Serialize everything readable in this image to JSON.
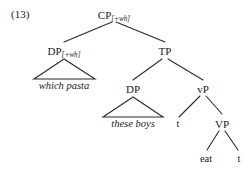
{
  "figure": {
    "example_number": "(13)",
    "type": "syntax-tree",
    "line_color": "#2b2b2b",
    "text_color": "#1a1a1a",
    "background": "#ffffff"
  },
  "nodes": {
    "cp": {
      "label": "CP",
      "subscript": "[+wh]"
    },
    "dp_wh": {
      "label": "DP",
      "subscript": "[+wh]"
    },
    "tp": {
      "label": "TP",
      "subscript": ""
    },
    "dp_subj": {
      "label": "DP",
      "subscript": ""
    },
    "vp_small": {
      "label": "vP",
      "subscript": ""
    },
    "vp_big": {
      "label": "VP",
      "subscript": ""
    }
  },
  "terminals": {
    "which_pasta": "which pasta",
    "these_boys": "these boys",
    "trace_subject": "t",
    "verb": "eat",
    "trace_object": "t"
  }
}
